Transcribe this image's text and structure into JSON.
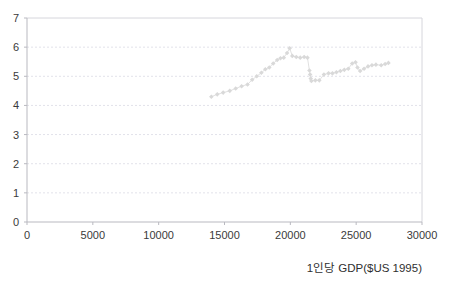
{
  "chart_data": {
    "type": "scatter",
    "title": "",
    "subtitle": "",
    "xlabel": "1인당 GDP($US 1995)",
    "ylabel": "",
    "xlim": [
      0,
      30000
    ],
    "ylim": [
      0,
      7
    ],
    "xticks": [
      0,
      5000,
      10000,
      15000,
      20000,
      25000,
      30000
    ],
    "yticks": [
      0,
      1,
      2,
      3,
      4,
      5,
      6,
      7
    ],
    "xtick_labels": [
      "0",
      "5000",
      "10000",
      "15000",
      "20000",
      "25000",
      "30000"
    ],
    "ytick_labels": [
      "0",
      "1",
      "2",
      "3",
      "4",
      "5",
      "6",
      "7"
    ],
    "grid": "horizontal-dotted",
    "legend": "none",
    "marker": "diamond",
    "marker_color": "#d9d9d9",
    "line_color": "#dcdcdc",
    "series": [
      {
        "name": "series-1",
        "points": [
          [
            14000,
            4.3
          ],
          [
            14450,
            4.38
          ],
          [
            14900,
            4.44
          ],
          [
            15400,
            4.5
          ],
          [
            15850,
            4.58
          ],
          [
            16300,
            4.66
          ],
          [
            16750,
            4.72
          ],
          [
            17100,
            4.88
          ],
          [
            17450,
            5.0
          ],
          [
            17800,
            5.12
          ],
          [
            18100,
            5.24
          ],
          [
            18400,
            5.3
          ],
          [
            18700,
            5.44
          ],
          [
            19000,
            5.56
          ],
          [
            19250,
            5.62
          ],
          [
            19500,
            5.64
          ],
          [
            19750,
            5.8
          ],
          [
            19950,
            5.96
          ],
          [
            20150,
            5.7
          ],
          [
            20450,
            5.66
          ],
          [
            20750,
            5.64
          ],
          [
            21050,
            5.66
          ],
          [
            21300,
            5.64
          ],
          [
            21450,
            5.2
          ],
          [
            21500,
            5.06
          ],
          [
            21550,
            4.92
          ],
          [
            21600,
            4.84
          ],
          [
            21900,
            4.86
          ],
          [
            22200,
            4.86
          ],
          [
            22550,
            5.06
          ],
          [
            22900,
            5.1
          ],
          [
            23200,
            5.1
          ],
          [
            23500,
            5.14
          ],
          [
            23800,
            5.18
          ],
          [
            24100,
            5.22
          ],
          [
            24400,
            5.26
          ],
          [
            24700,
            5.44
          ],
          [
            24950,
            5.48
          ],
          [
            25100,
            5.3
          ],
          [
            25300,
            5.18
          ],
          [
            25600,
            5.26
          ],
          [
            25900,
            5.34
          ],
          [
            26200,
            5.38
          ],
          [
            26500,
            5.4
          ],
          [
            26900,
            5.38
          ],
          [
            27200,
            5.42
          ],
          [
            27450,
            5.46
          ]
        ]
      }
    ]
  },
  "axis": {
    "x_title": "1인당 GDP($US 1995)"
  }
}
